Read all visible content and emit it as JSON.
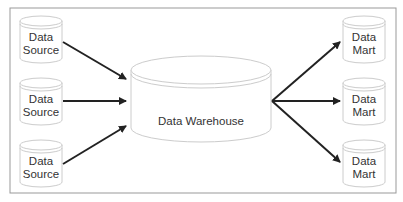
{
  "diagram": {
    "type": "data-warehouse-architecture",
    "sources": [
      {
        "line1": "Data",
        "line2": "Source"
      },
      {
        "line1": "Data",
        "line2": "Source"
      },
      {
        "line1": "Data",
        "line2": "Source"
      }
    ],
    "warehouse": {
      "label": "Data Warehouse"
    },
    "marts": [
      {
        "line1": "Data",
        "line2": "Mart"
      },
      {
        "line1": "Data",
        "line2": "Mart"
      },
      {
        "line1": "Data",
        "line2": "Mart"
      }
    ],
    "colors": {
      "border": "#999999",
      "cylinder": "#cccccc",
      "arrow": "#222222",
      "text": "#333333"
    }
  }
}
